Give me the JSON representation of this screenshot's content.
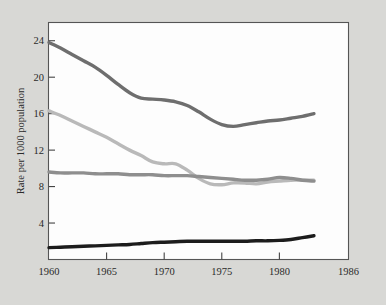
{
  "chart_data": {
    "type": "line",
    "title": "",
    "subtitle": "",
    "xlabel": "",
    "ylabel": "Rate per 1000 population",
    "xlim": [
      1960,
      1986
    ],
    "ylim": [
      0,
      26
    ],
    "grid": false,
    "legend_position": "none",
    "x_ticks": [
      1960,
      1965,
      1970,
      1975,
      1980,
      1986
    ],
    "x_tick_labels": [
      "1960",
      "1965",
      "1970",
      "1975",
      "1980",
      "1986"
    ],
    "y_ticks": [
      4,
      8,
      12,
      16,
      20,
      24
    ],
    "y_tick_labels": [
      "4",
      "8",
      "12",
      "16",
      "20",
      "24"
    ],
    "x": [
      1960,
      1961,
      1962,
      1963,
      1964,
      1965,
      1966,
      1967,
      1968,
      1969,
      1970,
      1971,
      1972,
      1973,
      1974,
      1975,
      1976,
      1977,
      1978,
      1979,
      1980,
      1981,
      1982,
      1983
    ],
    "series": [
      {
        "name": "birth-rate",
        "color": "#6e6e6e",
        "width": 3.4,
        "values": [
          23.8,
          23.2,
          22.5,
          21.8,
          21.1,
          20.2,
          19.2,
          18.3,
          17.7,
          17.6,
          17.5,
          17.3,
          16.9,
          16.2,
          15.4,
          14.8,
          14.6,
          14.8,
          15.0,
          15.2,
          15.3,
          15.5,
          15.7,
          16.0
        ]
      },
      {
        "name": "marriage-rate",
        "color": "#b9b9b9",
        "width": 3.4,
        "values": [
          16.3,
          15.8,
          15.2,
          14.6,
          14.0,
          13.4,
          12.7,
          12.0,
          11.4,
          10.7,
          10.5,
          10.5,
          9.8,
          8.9,
          8.3,
          8.2,
          8.4,
          8.4,
          8.3,
          8.5,
          8.6,
          8.7,
          8.7,
          8.7
        ]
      },
      {
        "name": "death-rate",
        "color": "#8e8e8e",
        "width": 3.4,
        "values": [
          9.6,
          9.5,
          9.5,
          9.5,
          9.4,
          9.4,
          9.4,
          9.3,
          9.3,
          9.3,
          9.2,
          9.2,
          9.2,
          9.1,
          9.0,
          8.9,
          8.8,
          8.7,
          8.7,
          8.8,
          9.0,
          8.9,
          8.7,
          8.6
        ]
      },
      {
        "name": "divorce-rate",
        "color": "#1c1c1c",
        "width": 3.4,
        "values": [
          1.3,
          1.35,
          1.4,
          1.45,
          1.5,
          1.55,
          1.6,
          1.65,
          1.75,
          1.85,
          1.9,
          1.95,
          2.0,
          2.0,
          2.0,
          2.0,
          2.0,
          2.0,
          2.05,
          2.05,
          2.1,
          2.2,
          2.4,
          2.6
        ]
      }
    ]
  },
  "axis": {
    "y_title": "Rate per 1000 population"
  }
}
